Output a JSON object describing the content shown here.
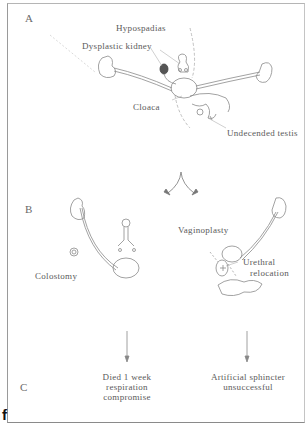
{
  "figure": {
    "panel_letter": "f",
    "sections": {
      "a": "A",
      "b": "B",
      "c": "C"
    },
    "section_a": {
      "labels": {
        "hypospadias": "Hypospadias",
        "dysplastic_kidney": "Dysplastic kidney",
        "cloaca": "Cloaca",
        "undescended_testis": "Undecended testis"
      }
    },
    "section_b": {
      "labels": {
        "colostomy": "Colostomy",
        "vaginoplasty": "Vaginoplasty",
        "urethral_relocation_1": "Urethral",
        "urethral_relocation_2": "relocation"
      }
    },
    "section_c": {
      "left_outcome": [
        "Died 1 week",
        "respiration",
        "compromise"
      ],
      "right_outcome": [
        "Artificial sphincter",
        "unsuccessful"
      ]
    },
    "colors": {
      "line": "#8a8a8a",
      "text": "#5a5a5a",
      "dark_kidney": "#555555"
    }
  }
}
